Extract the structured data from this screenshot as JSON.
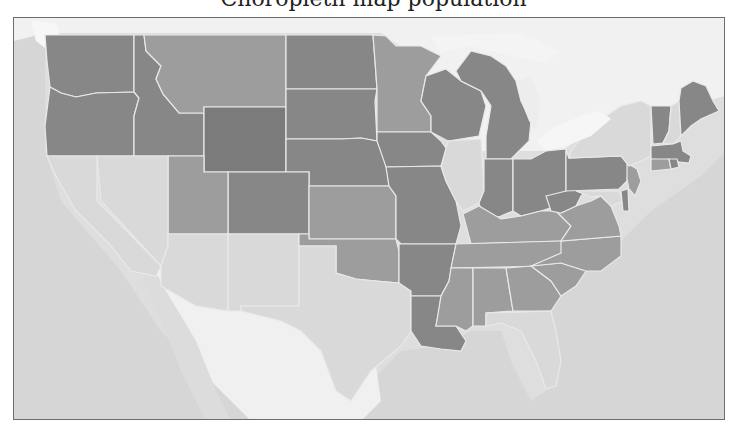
{
  "title": {
    "text": "Choropleth map population"
  },
  "map": {
    "type": "choropleth",
    "region": "United States (contiguous)",
    "colors": {
      "background_land": "#dedede",
      "ocean": "#d4d4d4",
      "lakes": "#f4f4f4",
      "mexico": "#efefef",
      "state_border": "#e9e9e9",
      "frame_border": "#6d6d6d",
      "levels": {
        "darkest": "#7b7b7b",
        "dark": "#878787",
        "medium": "#9d9d9d",
        "light": "#d9d9d9"
      }
    },
    "states": [
      {
        "id": "WA",
        "level": "dark"
      },
      {
        "id": "OR",
        "level": "dark"
      },
      {
        "id": "ID",
        "level": "dark"
      },
      {
        "id": "MT",
        "level": "medium"
      },
      {
        "id": "WY",
        "level": "darkest"
      },
      {
        "id": "ND",
        "level": "dark"
      },
      {
        "id": "SD",
        "level": "dark"
      },
      {
        "id": "NE",
        "level": "dark"
      },
      {
        "id": "CO",
        "level": "dark"
      },
      {
        "id": "UT",
        "level": "medium"
      },
      {
        "id": "NV",
        "level": "light"
      },
      {
        "id": "CA",
        "level": "light"
      },
      {
        "id": "AZ",
        "level": "light"
      },
      {
        "id": "NM",
        "level": "light"
      },
      {
        "id": "TX",
        "level": "light"
      },
      {
        "id": "KS",
        "level": "medium"
      },
      {
        "id": "OK",
        "level": "medium"
      },
      {
        "id": "MN",
        "level": "medium"
      },
      {
        "id": "IA",
        "level": "dark"
      },
      {
        "id": "MO",
        "level": "dark"
      },
      {
        "id": "AR",
        "level": "dark"
      },
      {
        "id": "LA",
        "level": "dark"
      },
      {
        "id": "WI",
        "level": "dark"
      },
      {
        "id": "IL",
        "level": "light"
      },
      {
        "id": "MI",
        "level": "dark"
      },
      {
        "id": "IN",
        "level": "dark"
      },
      {
        "id": "OH",
        "level": "dark"
      },
      {
        "id": "KY",
        "level": "medium"
      },
      {
        "id": "TN",
        "level": "medium"
      },
      {
        "id": "MS",
        "level": "medium"
      },
      {
        "id": "AL",
        "level": "medium"
      },
      {
        "id": "GA",
        "level": "medium"
      },
      {
        "id": "FL",
        "level": "light"
      },
      {
        "id": "SC",
        "level": "medium"
      },
      {
        "id": "NC",
        "level": "medium"
      },
      {
        "id": "VA",
        "level": "medium"
      },
      {
        "id": "WV",
        "level": "dark"
      },
      {
        "id": "PA",
        "level": "dark"
      },
      {
        "id": "NY",
        "level": "light"
      },
      {
        "id": "NJ",
        "level": "medium"
      },
      {
        "id": "DE",
        "level": "dark"
      },
      {
        "id": "MD",
        "level": "light"
      },
      {
        "id": "VT",
        "level": "dark"
      },
      {
        "id": "NH",
        "level": "light"
      },
      {
        "id": "ME",
        "level": "dark"
      },
      {
        "id": "MA",
        "level": "dark"
      },
      {
        "id": "CT",
        "level": "medium"
      },
      {
        "id": "RI",
        "level": "dark"
      }
    ]
  }
}
